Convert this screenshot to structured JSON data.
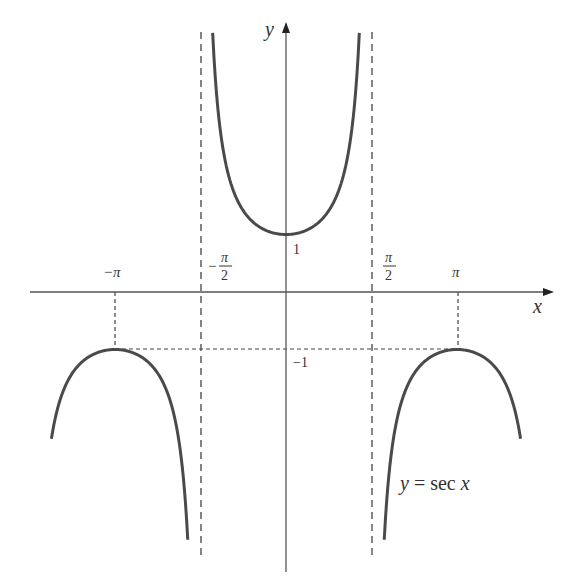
{
  "chart_data": {
    "type": "line",
    "title": "",
    "function_label": "y = sec x",
    "xlabel": "x",
    "ylabel": "y",
    "x_tick_labels": [
      "−π",
      "−π/2",
      "π/2",
      "π"
    ],
    "x_ticks": [
      -3.14159,
      -1.5708,
      1.5708,
      3.14159
    ],
    "y_tick_labels": [
      "1",
      "−1"
    ],
    "y_ticks": [
      1,
      -1
    ],
    "vertical_asymptotes": [
      -1.5708,
      1.5708
    ],
    "xlim": [
      -5.25,
      5.25
    ],
    "ylim": [
      -5.0,
      5.0
    ],
    "grid": false,
    "legend": "none",
    "series": [
      {
        "name": "sec x (branch -3π/2..-π/2)",
        "x": [
          -4.31,
          -3.93,
          -3.54,
          -3.14,
          -2.75,
          -2.36,
          -1.96,
          -1.81
        ],
        "y": [
          -2.6,
          -1.41,
          -1.08,
          -1.0,
          -1.08,
          -1.41,
          -2.6,
          -4.2
        ]
      },
      {
        "name": "sec x (branch -π/2..π/2)",
        "x": [
          -1.35,
          -1.18,
          -0.79,
          -0.39,
          0,
          0.39,
          0.79,
          1.18,
          1.35
        ],
        "y": [
          4.5,
          2.6,
          1.41,
          1.08,
          1.0,
          1.08,
          1.41,
          2.6,
          4.5
        ]
      },
      {
        "name": "sec x (branch π/2..3π/2)",
        "x": [
          1.81,
          1.96,
          2.36,
          2.75,
          3.14,
          3.54,
          3.93,
          4.31
        ],
        "y": [
          -4.2,
          -2.6,
          -1.41,
          -1.08,
          -1.0,
          -1.08,
          -1.41,
          -2.6
        ]
      }
    ]
  },
  "labels": {
    "x_axis": "x",
    "y_axis": "y",
    "neg_pi": "−π",
    "pi": "π",
    "neg_half_pi_sign": "−",
    "half_pi_num": "π",
    "half_pi_den": "2",
    "one": "1",
    "neg_one": "−1",
    "equation_y": "y",
    "equation_eq": " = sec ",
    "equation_x": "x"
  }
}
